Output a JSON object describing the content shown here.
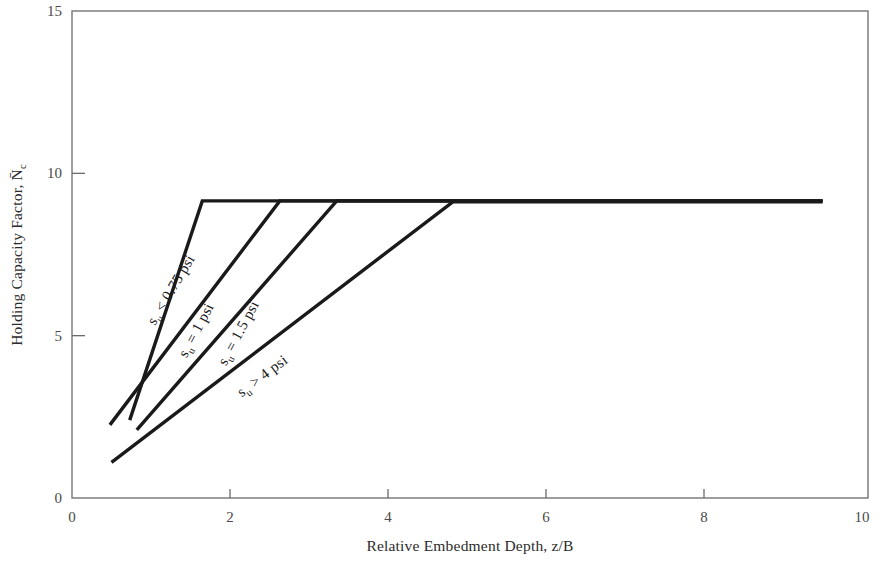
{
  "chart_data": {
    "type": "line",
    "title": "",
    "xlabel": "Relative Embedment Depth, z/B",
    "ylabel": "Holding Capacity Factor, N̄c",
    "ylabel_parts": {
      "prefix": "Holding Capacity Factor, ",
      "symbol": "N",
      "symbol_sub": "c",
      "overbar": true
    },
    "xlim": [
      0,
      10
    ],
    "ylim": [
      0,
      15
    ],
    "xticks": [
      0,
      2,
      4,
      6,
      8,
      10
    ],
    "xtick_labels": [
      "0",
      "2",
      "4",
      "6",
      "8",
      "10"
    ],
    "yticks": [
      0,
      5,
      10,
      15
    ],
    "ytick_labels": [
      "0",
      "5",
      "10",
      "15"
    ],
    "grid": false,
    "legend": "inline-curve-labels",
    "plateau_value": 9.15,
    "series": [
      {
        "name": "s_u < 0.75 psi",
        "label_text": "s",
        "label_sub": "u",
        "label_rest": " < 0.75 psi",
        "label_x": 1.05,
        "label_y": 5.3,
        "label_angle": -59,
        "points": [
          [
            0.73,
            2.4
          ],
          [
            1.65,
            9.15
          ],
          [
            9.5,
            9.15
          ]
        ]
      },
      {
        "name": "s_u = 1 psi",
        "label_text": "s",
        "label_sub": "u",
        "label_rest": " = 1 psi",
        "label_x": 1.45,
        "label_y": 4.3,
        "label_angle": -62,
        "points": [
          [
            0.48,
            2.25
          ],
          [
            2.63,
            9.15
          ],
          [
            9.5,
            9.15
          ]
        ]
      },
      {
        "name": "s_u = 1.5 psi",
        "label_text": "s",
        "label_sub": "u",
        "label_rest": " = 1.5 psi",
        "label_x": 1.95,
        "label_y": 4.05,
        "label_angle": -62,
        "points": [
          [
            0.82,
            2.1
          ],
          [
            3.35,
            9.15
          ],
          [
            9.5,
            9.15
          ]
        ]
      },
      {
        "name": "s_u > 4 psi",
        "label_text": "s",
        "label_sub": "u",
        "label_rest": " > 4 psi",
        "label_x": 2.15,
        "label_y": 3.1,
        "label_angle": -37,
        "points": [
          [
            0.5,
            1.1
          ],
          [
            4.82,
            9.12
          ],
          [
            9.5,
            9.12
          ]
        ]
      }
    ]
  },
  "colors": {
    "line": "#1a1a1a",
    "axis": "#6b6b6b",
    "text": "#2b2b2b",
    "background": "#ffffff"
  },
  "geometry": {
    "plot_left": 72,
    "plot_right": 862,
    "plot_top": 11,
    "plot_bottom": 498,
    "frame_right": 868
  }
}
